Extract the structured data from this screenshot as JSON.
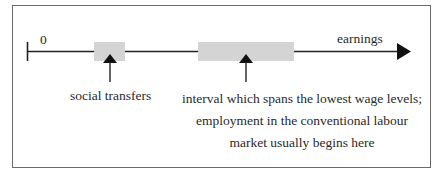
{
  "diagram": {
    "axis": {
      "origin_label": "0",
      "end_label": "earnings"
    },
    "regions": [
      {
        "id": "social-transfers",
        "label": "social transfers",
        "color": "#d4d4d4"
      },
      {
        "id": "lowest-wage-interval",
        "label_lines": [
          "interval which spans the lowest wage levels;",
          "employment in the conventional labour",
          "market usually begins here"
        ],
        "color": "#d4d4d4"
      }
    ],
    "colors": {
      "line": "#222222",
      "frame": "#6a6a6a",
      "box_fill": "#d4d4d4"
    }
  }
}
